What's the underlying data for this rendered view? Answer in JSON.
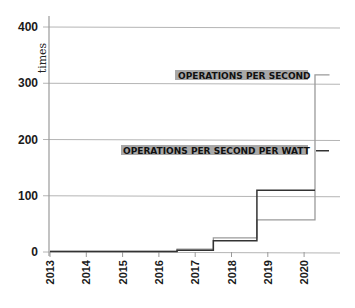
{
  "chart_data": {
    "type": "line",
    "step": true,
    "title": "",
    "xlabel": "",
    "ylabel": "times",
    "ylim": [
      0,
      400
    ],
    "xlim": [
      2013,
      2020.9
    ],
    "yticks": [
      "0",
      "100",
      "200",
      "300",
      "400"
    ],
    "xticks": [
      "2013",
      "2014",
      "2015",
      "2016",
      "2017",
      "2018",
      "2019",
      "2020"
    ],
    "grid": true,
    "legend": "inline labels at right",
    "series": [
      {
        "name": "OPERATIONS PER SECOND",
        "color": "#9a9a9a",
        "x": [
          2013,
          2016.5,
          2017.5,
          2018.7,
          2020.3,
          2020.7
        ],
        "values": [
          1,
          5,
          25,
          57,
          315,
          315
        ]
      },
      {
        "name": "OPERATIONS PER SECOND PER WATT",
        "color": "#333333",
        "x": [
          2013,
          2016.5,
          2017.5,
          2018.7,
          2020.3
        ],
        "values": [
          1,
          3,
          20,
          110,
          110
        ],
        "end_marker_value": 180
      }
    ]
  },
  "labels": {
    "ops": "OPERATIONS PER SECOND",
    "ops_watt": "OPERATIONS PER SECOND PER WATT",
    "ylabel": "times"
  },
  "colors": {
    "grid": "#b5b5b5",
    "axis": "#9a9a9a",
    "ops_line": "#9a9a9a",
    "ops_watt_line": "#333333",
    "label_highlight": "#a8a8a8"
  }
}
